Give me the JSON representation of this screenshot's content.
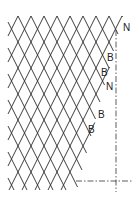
{
  "diagram": {
    "type": "diamond mesh / netting pattern",
    "colors": {
      "line": "#2a2a2a",
      "background": "#ffffff"
    },
    "labels": [
      {
        "text": "N",
        "x": 123,
        "y": 31
      },
      {
        "text": "B",
        "x": 107,
        "y": 61
      },
      {
        "text": "B",
        "x": 101,
        "y": 76
      },
      {
        "text": "N",
        "x": 106,
        "y": 90
      },
      {
        "text": "B",
        "x": 98,
        "y": 118
      },
      {
        "text": "B",
        "x": 88,
        "y": 133
      }
    ],
    "centerlines": [
      {
        "orientation": "vertical",
        "x": 116,
        "y1": 30,
        "y2": 192
      },
      {
        "orientation": "horizontal",
        "y": 181,
        "x1": 76,
        "x2": 132
      }
    ]
  }
}
